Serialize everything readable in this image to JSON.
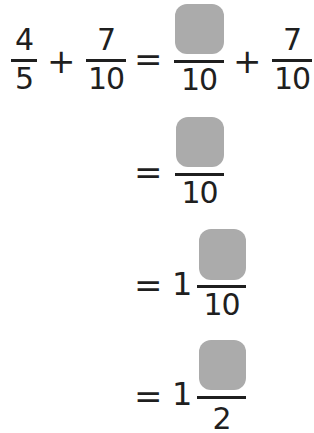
{
  "equation": {
    "row1": {
      "lhs_fraction_1": {
        "numerator": "4",
        "denominator": "5"
      },
      "operator_1": "+",
      "lhs_fraction_2": {
        "numerator": "7",
        "denominator": "10"
      },
      "equals": "=",
      "rhs_fraction_1": {
        "numerator": "",
        "denominator": "10",
        "numerator_blank": true
      },
      "operator_2": "+",
      "rhs_fraction_2": {
        "numerator": "7",
        "denominator": "10"
      }
    },
    "row2": {
      "equals": "=",
      "fraction": {
        "numerator": "",
        "denominator": "10",
        "numerator_blank": true
      }
    },
    "row3": {
      "equals": "=",
      "whole": "1",
      "fraction": {
        "numerator": "",
        "denominator": "10",
        "numerator_blank": true
      }
    },
    "row4": {
      "equals": "=",
      "whole": "1",
      "fraction": {
        "numerator": "",
        "denominator": "2",
        "numerator_blank": true
      }
    }
  },
  "colors": {
    "blank_box": "#ababab",
    "text": "#1f1f1f",
    "background": "#ffffff"
  }
}
